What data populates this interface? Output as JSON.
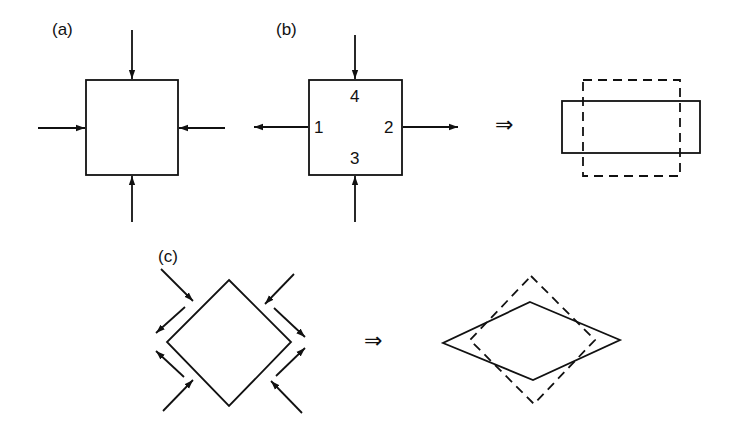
{
  "panels": {
    "a": {
      "label": "(a)",
      "description": "Square under uniform compression from all four sides"
    },
    "b": {
      "label": "(b)",
      "description": "Square compressed top/bottom, extended left/right",
      "side_labels": {
        "left": "1",
        "right": "2",
        "bottom": "3",
        "top": "4"
      },
      "implies": "⇒",
      "result": "Dashed original square vs solid wide rectangle"
    },
    "c": {
      "label": "(c)",
      "description": "Diamond (45° rotated square) under shear-type loading",
      "implies": "⇒",
      "result": "Dashed original diamond vs solid flattened rhombus"
    }
  },
  "colors": {
    "stroke": "#111111",
    "background": "#ffffff"
  }
}
